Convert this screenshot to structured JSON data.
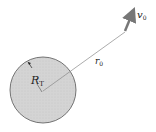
{
  "diagram": {
    "planet": {
      "label": "R",
      "label_sub": "T",
      "fill": "#d6d6d6",
      "stroke": "#555555"
    },
    "position": {
      "label": "r",
      "label_sub": "0"
    },
    "velocity": {
      "label": "v",
      "label_sub": "0",
      "color": "#777777"
    }
  }
}
